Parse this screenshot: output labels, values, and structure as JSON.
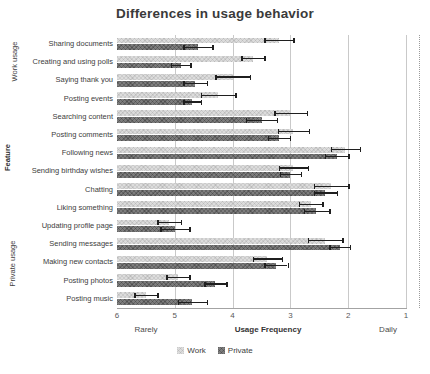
{
  "title": "Differences in usage behavior",
  "chart_data": {
    "type": "bar",
    "orientation": "horizontal",
    "title": "Differences in usage behavior",
    "categories": [
      "Sharing documents",
      "Creating and using polls",
      "Saying thank you",
      "Posting events",
      "Searching content",
      "Posting comments",
      "Following news",
      "Sending birthday wishes",
      "Chatting",
      "Liking something",
      "Updating profile page",
      "Sending messages",
      "Making new contacts",
      "Posting photos",
      "Posting music"
    ],
    "series": [
      {
        "name": "Work",
        "color": "#dcdcdc",
        "values": [
          3.2,
          3.65,
          4.0,
          4.25,
          3.0,
          2.95,
          2.05,
          2.95,
          2.3,
          2.65,
          5.1,
          2.4,
          3.4,
          4.95,
          5.5
        ],
        "errors": [
          0.25,
          0.2,
          0.3,
          0.3,
          0.28,
          0.27,
          0.25,
          0.25,
          0.3,
          0.2,
          0.2,
          0.3,
          0.25,
          0.2,
          0.2
        ]
      },
      {
        "name": "Private",
        "color": "#7d7d7d",
        "values": [
          4.6,
          4.9,
          4.65,
          4.7,
          3.5,
          3.2,
          2.2,
          3.0,
          2.4,
          2.55,
          5.0,
          2.15,
          3.25,
          4.3,
          4.7
        ],
        "errors": [
          0.25,
          0.17,
          0.2,
          0.15,
          0.27,
          0.19,
          0.2,
          0.18,
          0.2,
          0.22,
          0.25,
          0.18,
          0.2,
          0.19,
          0.25
        ]
      }
    ],
    "x_axis": {
      "label": "Usage Frequency",
      "ticks": [
        6,
        5,
        4,
        3,
        2,
        1
      ],
      "reversed": true,
      "range": [
        6,
        1
      ],
      "left_caption": "Rarely",
      "right_caption": "Daily"
    },
    "y_axis": {
      "label": "Feature",
      "group_labels": [
        "Work usage",
        "Private usage"
      ]
    },
    "legend": {
      "position": "bottom",
      "entries": [
        "Work",
        "Private"
      ]
    },
    "grid": true,
    "error_bar_color": "#1f1f1f",
    "gridline_color": "#c9c9c9"
  }
}
